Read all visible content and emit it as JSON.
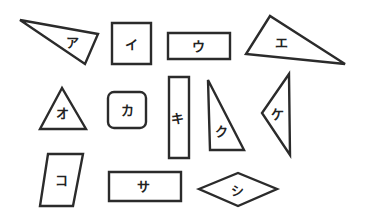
{
  "colors": {
    "stroke": "#2b2b2b",
    "background": "#ffffff",
    "text": "#222222"
  },
  "shapes": [
    {
      "label": "ア",
      "type": "triangle",
      "points": "20,20 98,34 85,64",
      "lx": 72,
      "ly": 42
    },
    {
      "label": "イ",
      "type": "square",
      "points": "112,23 151,23 151,64 112,64",
      "lx": 131,
      "ly": 44
    },
    {
      "label": "ウ",
      "type": "rectangle",
      "points": "168,33 230,33 230,59 168,59",
      "lx": 198,
      "ly": 46
    },
    {
      "label": "エ",
      "type": "triangle",
      "points": "270,16 246,54 345,64",
      "lx": 281,
      "ly": 42
    },
    {
      "label": "オ",
      "type": "triangle",
      "points": "62,88 40,129 86,129",
      "lx": 62,
      "ly": 113
    },
    {
      "label": "カ",
      "type": "rounded-square",
      "x": 108,
      "y": 92,
      "w": 38,
      "h": 36,
      "r": 6,
      "lx": 127,
      "ly": 110
    },
    {
      "label": "キ",
      "type": "rectangle",
      "points": "169,77 189,77 189,158 169,158",
      "lx": 177,
      "ly": 118
    },
    {
      "label": "ク",
      "type": "triangle",
      "points": "208,80 210,150 244,150",
      "lx": 221,
      "ly": 131
    },
    {
      "label": "ケ",
      "type": "triangle",
      "points": "289,74 262,113 290,155",
      "lx": 277,
      "ly": 114
    },
    {
      "label": "コ",
      "type": "parallelogram",
      "points": "48,154 83,154 73,206 40,206",
      "lx": 61,
      "ly": 180
    },
    {
      "label": "サ",
      "type": "rectangle",
      "points": "109,172 181,172 181,201 109,201",
      "lx": 143,
      "ly": 186
    },
    {
      "label": "シ",
      "type": "rhombus",
      "points": "199,189 238,173 277,189 238,206",
      "lx": 237,
      "ly": 190
    }
  ]
}
